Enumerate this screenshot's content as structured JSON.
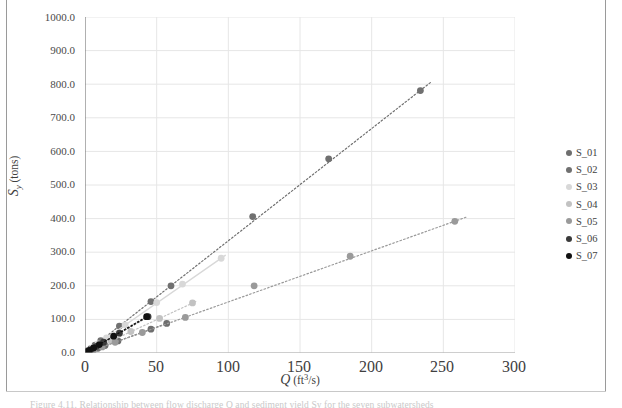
{
  "figure": {
    "caption_fragment": "Figure 4.11. Relationship between flow discharge Q and sediment yield Sy for the seven subwatersheds"
  },
  "legend": {
    "position": "right",
    "entries": [
      {
        "label": "S_01",
        "color": "#6e6e6e"
      },
      {
        "label": "S_02",
        "color": "#707070"
      },
      {
        "label": "S_03",
        "color": "#d8d8d8"
      },
      {
        "label": "S_04",
        "color": "#c2c2c2"
      },
      {
        "label": "S_05",
        "color": "#9a9a9a"
      },
      {
        "label": "S_06",
        "color": "#3a3a3a"
      },
      {
        "label": "S_07",
        "color": "#111111"
      }
    ]
  },
  "axes": {
    "x_label_symbol": "Q",
    "x_label_units": "(ft",
    "x_label_exp": "3",
    "x_label_units2": "/s)",
    "y_label_symbol": "S",
    "y_label_sub": "y",
    "y_label_units": "(tons)",
    "x_ticks": [
      "0",
      "50",
      "100",
      "150",
      "200",
      "250",
      "300"
    ],
    "y_ticks": [
      "0.0",
      "100.0",
      "200.0",
      "300.0",
      "400.0",
      "500.0",
      "600.0",
      "700.0",
      "800.0",
      "900.0",
      "1000.0"
    ]
  },
  "chart_data": {
    "type": "scatter",
    "title": "",
    "xlabel": "Q (ft3/s)",
    "ylabel": "Sy (tons)",
    "xlim": [
      0,
      300
    ],
    "ylim": [
      0,
      1000
    ],
    "grid": true,
    "legend_position": "right",
    "trendline_style": "dotted through origin",
    "series": [
      {
        "name": "S_01",
        "color": "#6e6e6e",
        "marker": "circle",
        "line": "dotted",
        "slope": 1.54,
        "points": [
          [
            0.6,
            1
          ],
          [
            1.5,
            2.5
          ],
          [
            3,
            5
          ],
          [
            5.5,
            9
          ],
          [
            9,
            14
          ],
          [
            14,
            22
          ],
          [
            23,
            36
          ],
          [
            46,
            71
          ],
          [
            57,
            88
          ]
        ]
      },
      {
        "name": "S_02",
        "color": "#707070",
        "marker": "circle",
        "line": "dotted",
        "slope": 3.34,
        "points": [
          [
            0.8,
            3
          ],
          [
            2,
            7
          ],
          [
            4,
            13
          ],
          [
            7,
            23
          ],
          [
            11,
            37
          ],
          [
            24,
            80
          ],
          [
            46,
            153
          ],
          [
            60,
            200
          ],
          [
            117,
            406
          ],
          [
            170,
            578
          ],
          [
            234,
            781
          ]
        ]
      },
      {
        "name": "S_03",
        "color": "#d8d8d8",
        "marker": "circle",
        "line": "solid",
        "slope": 2.97,
        "points": [
          [
            1,
            3
          ],
          [
            2.5,
            8
          ],
          [
            5,
            15
          ],
          [
            9,
            27
          ],
          [
            15,
            45
          ],
          [
            28,
            84
          ],
          [
            50,
            150
          ],
          [
            68,
            205
          ],
          [
            95,
            282
          ]
        ]
      },
      {
        "name": "S_04",
        "color": "#c2c2c2",
        "marker": "circle",
        "line": "dotted",
        "slope": 1.98,
        "points": [
          [
            1,
            2
          ],
          [
            3,
            6
          ],
          [
            6,
            12
          ],
          [
            11,
            22
          ],
          [
            18,
            36
          ],
          [
            32,
            64
          ],
          [
            52,
            103
          ],
          [
            75,
            149
          ]
        ]
      },
      {
        "name": "S_05",
        "color": "#9a9a9a",
        "marker": "circle",
        "line": "dotted",
        "slope": 1.52,
        "points": [
          [
            1,
            2
          ],
          [
            3,
            4
          ],
          [
            6,
            9
          ],
          [
            12,
            18
          ],
          [
            21,
            32
          ],
          [
            40,
            61
          ],
          [
            70,
            106
          ],
          [
            118,
            200
          ],
          [
            185,
            288
          ],
          [
            258,
            392
          ]
        ]
      },
      {
        "name": "S_06",
        "color": "#3a3a3a",
        "marker": "circle",
        "line": "dotted",
        "slope": 2.45,
        "points": [
          [
            0.7,
            2
          ],
          [
            2,
            5
          ],
          [
            4,
            10
          ],
          [
            8,
            20
          ],
          [
            13,
            32
          ],
          [
            24,
            59
          ],
          [
            44,
            108
          ]
        ]
      },
      {
        "name": "S_07",
        "color": "#111111",
        "marker": "circle",
        "line": "dotted",
        "slope": 2.52,
        "points": [
          [
            0.5,
            1
          ],
          [
            1.5,
            4
          ],
          [
            3,
            8
          ],
          [
            6,
            15
          ],
          [
            10,
            25
          ],
          [
            20,
            50
          ],
          [
            43,
            108
          ]
        ]
      }
    ]
  }
}
